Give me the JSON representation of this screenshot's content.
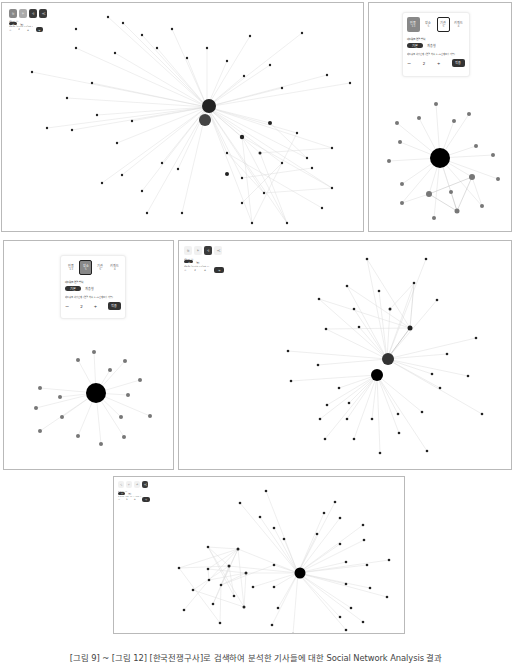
{
  "figure": {
    "caption": "[그림 9] ~ [그림 12] [한국전쟁구사]로 검색하여 분석한 기사들에 대한 Social Network Analysis 결과"
  },
  "controls": {
    "tabs": [
      {
        "label": "인물",
        "count": "13"
      },
      {
        "label": "장소",
        "count": "5"
      },
      {
        "label": "기관",
        "count": "5"
      },
      {
        "label": "키워드",
        "count": "4"
      }
    ],
    "layout_label": "네트워크 연결 방식",
    "layout_options": [
      "기본",
      "계층형"
    ],
    "depth_label": "네트워크 확장 단계 (연결 차수, 1~5단계 조정 가능)",
    "depth_value": "2",
    "minus": "−",
    "plus": "+",
    "apply_label": "적용"
  },
  "panels": [
    {
      "id": "fig9",
      "active_tab": "키워드",
      "description": "키워드 네트워크 (대규모)"
    },
    {
      "id": "fig10",
      "active_tab": "인물",
      "center_node": "김구"
    },
    {
      "id": "fig11",
      "active_tab": "장소",
      "center_node": "한국"
    },
    {
      "id": "fig12",
      "active_tab": "기관",
      "description": "기관 네트워크"
    },
    {
      "id": "fig13",
      "active_tab": "키워드",
      "description": "키워드 네트워크"
    }
  ],
  "colors": {
    "node": "#222222",
    "edge": "#d9d9d9",
    "active_tab": "#3a3a3a",
    "border": "#b9b9b9"
  }
}
